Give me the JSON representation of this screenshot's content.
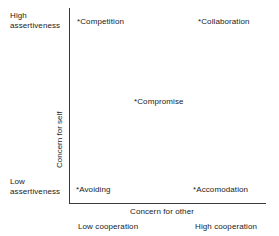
{
  "chart_data": {
    "type": "scatter",
    "title": "",
    "xlabel": "Concern for other",
    "ylabel": "Concern for self",
    "xlim": [
      0,
      1
    ],
    "ylim": [
      0,
      1
    ],
    "grid": false,
    "legend": "none",
    "axis_end_labels": {
      "y_top": "High assertiveness",
      "y_bottom": "Low assertiveness",
      "x_left": "Low cooperation",
      "x_right": "High cooperation"
    },
    "point_marker": "*",
    "points": [
      {
        "label": "Competition",
        "x": 0.05,
        "y": 0.95
      },
      {
        "label": "Collaboration",
        "x": 0.68,
        "y": 0.95
      },
      {
        "label": "Compromise",
        "x": 0.35,
        "y": 0.53
      },
      {
        "label": "Avoiding",
        "x": 0.04,
        "y": 0.08
      },
      {
        "label": "Accomodation",
        "x": 0.65,
        "y": 0.08
      }
    ]
  },
  "axes": {
    "y_title": "Concern for self",
    "x_title": "Concern for other",
    "y_high_line1": "High",
    "y_high_line2": "assertiveness",
    "y_low_line1": "Low",
    "y_low_line2": "assertiveness",
    "x_low": "Low cooperation",
    "x_high": "High cooperation",
    "line_color": "#3a3a3a"
  },
  "points": {
    "competition": "*Competition",
    "collaboration": "*Collaboration",
    "compromise": "*Compromise",
    "avoiding": "*Avoiding",
    "accomodation": "*Accomodation"
  }
}
